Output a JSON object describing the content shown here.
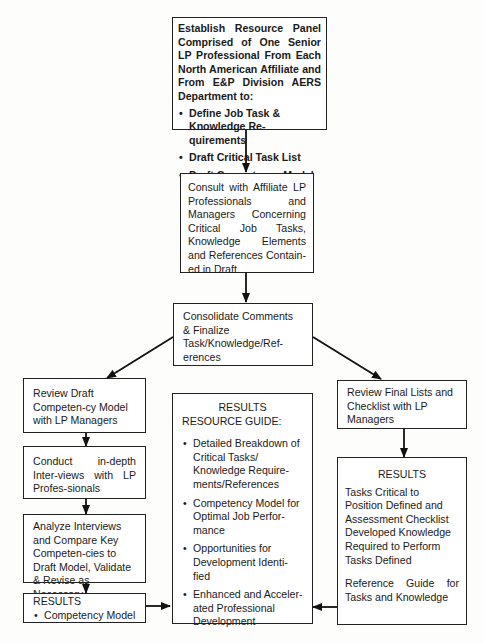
{
  "diagram": {
    "type": "flowchart",
    "nodes": {
      "establish_panel": {
        "text": "Establish Resource Panel Comprised of One Senior LP Professional From Each North American Affiliate and From E&P Division AERS Department to:",
        "bullets": [
          "Define Job Task & Knowledge Re-quirements",
          "Draft Critical Task List",
          "Draft Competency Model"
        ]
      },
      "consult": {
        "text": "Consult with Affiliate LP Professionals and Managers Concerning Critical Job Tasks, Knowledge Elements and References Contain-ed in Draft"
      },
      "consolidate": {
        "text": "Consolidate Comments & Finalize Task/Knowledge/Ref-erences"
      },
      "review_draft": {
        "text": "Review Draft Competen-cy Model with LP Managers"
      },
      "conduct_interviews": {
        "text": "Conduct in-depth Inter-views with LP Profes-sionals"
      },
      "analyze_interviews": {
        "text": "Analyze Interviews and Compare Key Competen-cies to Draft Model, Validate & Revise as Necessary"
      },
      "results_competency": {
        "title": "RESULTS",
        "bullets": [
          "Competency Model"
        ]
      },
      "resource_guide": {
        "title_line1": "RESULTS",
        "title_line2": "RESOURCE GUIDE:",
        "bullets": [
          "Detailed Breakdown of Critical Tasks/ Knowledge Require-ments/References",
          "Competency Model for Optimal Job Perfor-mance",
          "Opportunities for Development Identi-fied",
          "Enhanced and Acceler-ated Professional Development"
        ]
      },
      "review_final": {
        "text": "Review Final Lists and Checklist with LP Managers"
      },
      "results_tasks": {
        "title": "RESULTS",
        "para1": "Tasks Critical to Position Defined and Assessment Checklist Developed Knowledge Required to Perform Tasks Defined",
        "para2": "Reference Guide for Tasks and Knowledge"
      }
    },
    "edges": [
      {
        "from": "establish_panel",
        "to": "consult"
      },
      {
        "from": "consult",
        "to": "consolidate"
      },
      {
        "from": "consolidate",
        "to": "review_draft"
      },
      {
        "from": "consolidate",
        "to": "review_final"
      },
      {
        "from": "review_draft",
        "to": "conduct_interviews"
      },
      {
        "from": "conduct_interviews",
        "to": "analyze_interviews"
      },
      {
        "from": "analyze_interviews",
        "to": "results_competency"
      },
      {
        "from": "results_competency",
        "to": "resource_guide"
      },
      {
        "from": "review_final",
        "to": "results_tasks"
      },
      {
        "from": "results_tasks",
        "to": "resource_guide"
      }
    ]
  }
}
